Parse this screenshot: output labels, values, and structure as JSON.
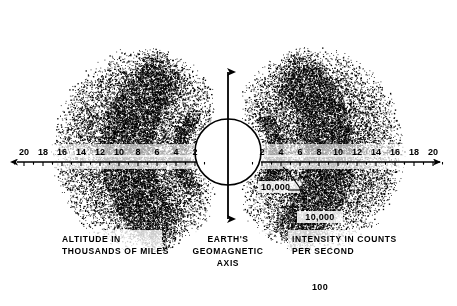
{
  "figure": {
    "background_color": "#ffffff",
    "ink_color": "#000000"
  },
  "chart_data": {
    "type": "diagram",
    "xlabel": "ALTITUDE IN THOUSANDS OF MILES",
    "ylabel": "EARTH'S GEOMAGNETIC AXIS",
    "legend_label": "INTENSITY IN COUNTS PER SECOND",
    "x_left_ticks": [
      20,
      18,
      16,
      14,
      12,
      10,
      8,
      6,
      4,
      2
    ],
    "x_right_ticks": [
      2,
      4,
      6,
      8,
      10,
      12,
      14,
      16,
      18,
      20
    ],
    "xlim": [
      -20,
      20
    ],
    "grid": false,
    "intensity_contours": [
      {
        "label": "10,000",
        "value": 10000
      },
      {
        "label": "10,000",
        "value": 10000
      },
      {
        "label": "100",
        "value": 100
      }
    ],
    "annotations": [
      {
        "text": "10,000",
        "x": 4,
        "y": -3,
        "note": "inner belt intensity, leader line"
      },
      {
        "text": "10,000",
        "x": 9,
        "y": -7,
        "note": "outer belt core intensity"
      },
      {
        "text": "100",
        "x": 10,
        "y": -14,
        "note": "outer diffuse envelope intensity"
      }
    ]
  },
  "axis": {
    "left_ticks": [
      {
        "label": "20",
        "x": 24
      },
      {
        "label": "18",
        "x": 43
      },
      {
        "label": "16",
        "x": 62
      },
      {
        "label": "14",
        "x": 81
      },
      {
        "label": "12",
        "x": 100
      },
      {
        "label": "10",
        "x": 119
      },
      {
        "label": "8",
        "x": 138
      },
      {
        "label": "6",
        "x": 157
      },
      {
        "label": "4",
        "x": 176
      },
      {
        "label": "2",
        "x": 195
      }
    ],
    "right_ticks": [
      {
        "label": "2",
        "x": 262
      },
      {
        "label": "4",
        "x": 281
      },
      {
        "label": "6",
        "x": 300
      },
      {
        "label": "8",
        "x": 319
      },
      {
        "label": "10",
        "x": 338
      },
      {
        "label": "12",
        "x": 357
      },
      {
        "label": "14",
        "x": 376
      },
      {
        "label": "16",
        "x": 395
      },
      {
        "label": "18",
        "x": 414
      },
      {
        "label": "20",
        "x": 433
      }
    ]
  },
  "labels": {
    "altitude_line1": "ALTITUDE IN",
    "altitude_line2": "THOUSANDS OF MILES",
    "axis_line1": "EARTH'S",
    "axis_line2": "GEOMAGNETIC",
    "axis_line3": "AXIS",
    "intensity_line1": "INTENSITY IN COUNTS",
    "intensity_line2": "PER SECOND",
    "inner_belt_value": "10,000",
    "outer_belt_value": "10,000",
    "envelope_value": "100"
  }
}
